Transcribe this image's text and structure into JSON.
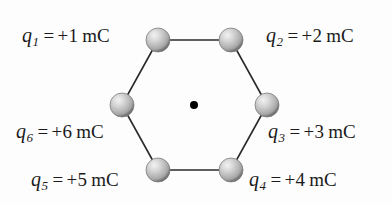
{
  "figure": {
    "background_color": "#fdfdfd",
    "line_color": "#2b2b2b",
    "sphere_color": "#b9b9b9",
    "sphere_highlight_color": "#e8e8e8",
    "center_dot_color": "#000000"
  },
  "charges": [
    {
      "id": "q1",
      "symbol": "q",
      "subscript": "1",
      "equals": "=",
      "value": "+1",
      "unit": "mC",
      "full_text": "q1 = +1 mC",
      "vertex": "top-left",
      "cx": 158,
      "cy": 40
    },
    {
      "id": "q2",
      "symbol": "q",
      "subscript": "2",
      "equals": "=",
      "value": "+2",
      "unit": "mC",
      "full_text": "q2 = +2 mC",
      "vertex": "top-right",
      "cx": 231,
      "cy": 40
    },
    {
      "id": "q3",
      "symbol": "q",
      "subscript": "3",
      "equals": "=",
      "value": "+3",
      "unit": "mC",
      "full_text": "q3 = +3 mC",
      "vertex": "middle-right",
      "cx": 267,
      "cy": 105
    },
    {
      "id": "q4",
      "symbol": "q",
      "subscript": "4",
      "equals": "=",
      "value": "+4",
      "unit": "mC",
      "full_text": "q4 = +4 mC",
      "vertex": "bottom-right",
      "cx": 231,
      "cy": 170
    },
    {
      "id": "q5",
      "symbol": "q",
      "subscript": "5",
      "equals": "=",
      "value": "+5",
      "unit": "mC",
      "full_text": "q5 = +5 mC",
      "vertex": "bottom-left",
      "cx": 158,
      "cy": 170
    },
    {
      "id": "q6",
      "symbol": "q",
      "subscript": "6",
      "equals": "=",
      "value": "+6",
      "unit": "mC",
      "full_text": "q6 = +6 mC",
      "vertex": "middle-left",
      "cx": 122,
      "cy": 105
    }
  ],
  "center_point": {
    "label": "center",
    "cx": 194,
    "cy": 105,
    "radius": 4
  }
}
